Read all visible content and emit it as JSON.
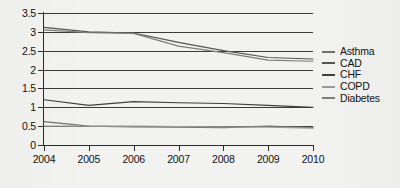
{
  "chart_data": {
    "type": "line",
    "title": "",
    "subtitle": "",
    "xlabel": "",
    "ylabel": "",
    "x": [
      2004,
      2005,
      2006,
      2007,
      2008,
      2009,
      2010
    ],
    "categories": [
      "2004",
      "2005",
      "2006",
      "2007",
      "2008",
      "2009",
      "2010"
    ],
    "ylim": [
      0,
      3.5
    ],
    "yticks": [
      0,
      0.5,
      1,
      1.5,
      2,
      2.5,
      3,
      3.5
    ],
    "ytick_labels": [
      "0",
      "0.5",
      "1",
      "1.5",
      "2",
      "2.5",
      "3",
      "3.5"
    ],
    "xlim": [
      2004,
      2010
    ],
    "grid": "horizontal",
    "legend_position": "right",
    "series": [
      {
        "name": "Asthma",
        "color": "#6f6f6f",
        "values": [
          0.62,
          0.5,
          0.48,
          0.47,
          0.46,
          0.5,
          0.46
        ]
      },
      {
        "name": "CAD",
        "color": "#555555",
        "values": [
          3.12,
          3.0,
          2.97,
          2.72,
          2.5,
          2.32,
          2.28
        ]
      },
      {
        "name": "CHF",
        "color": "#3f3f3f",
        "values": [
          1.2,
          1.05,
          1.15,
          1.12,
          1.1,
          1.05,
          1.0
        ]
      },
      {
        "name": "COPD",
        "color": "#9a9a9a",
        "values": [
          0.5,
          0.5,
          0.5,
          0.49,
          0.48,
          0.47,
          0.45
        ]
      },
      {
        "name": "Diabetes",
        "color": "#7d7d7d",
        "values": [
          3.05,
          2.98,
          2.96,
          2.62,
          2.45,
          2.25,
          2.22
        ]
      }
    ]
  },
  "legend": {
    "items": [
      {
        "label": "Asthma"
      },
      {
        "label": "CAD"
      },
      {
        "label": "CHF"
      },
      {
        "label": "COPD"
      },
      {
        "label": "Diabetes"
      }
    ]
  }
}
